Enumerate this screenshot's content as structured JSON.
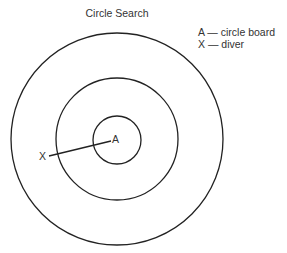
{
  "diagram": {
    "title": "Circle Search",
    "legend": [
      {
        "symbol": "A",
        "separator": "—",
        "meaning": "circle board",
        "text": "A — circle board"
      },
      {
        "symbol": "X",
        "separator": "—",
        "meaning": "diver",
        "text": "X — diver"
      }
    ],
    "labels": {
      "center": "A",
      "diver": "X"
    },
    "circles": [
      {
        "name": "inner",
        "cx": 117,
        "cy": 140,
        "r": 24
      },
      {
        "name": "middle",
        "cx": 117,
        "cy": 139,
        "r": 61
      },
      {
        "name": "outer",
        "cx": 117,
        "cy": 139,
        "r": 106
      }
    ],
    "line": {
      "x1": 49,
      "y1": 156,
      "x2": 111,
      "y2": 141
    },
    "stroke_color": "#222222"
  }
}
